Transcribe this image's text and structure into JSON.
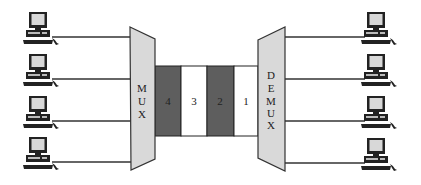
{
  "diagram": {
    "type": "time-division multiplexing",
    "mux": {
      "label_letters": [
        "M",
        "U",
        "X"
      ],
      "fill": "#d9d9d9"
    },
    "demux": {
      "label_letters": [
        "D",
        "E",
        "M",
        "U",
        "X"
      ],
      "fill": "#d9d9d9"
    },
    "slots": [
      {
        "label": "4",
        "fill": "#5e5e5e"
      },
      {
        "label": "3",
        "fill": "#ffffff"
      },
      {
        "label": "2",
        "fill": "#5e5e5e"
      },
      {
        "label": "1",
        "fill": "#ffffff"
      }
    ],
    "left_computers": 4,
    "right_computers": 4,
    "line_color": "#333333"
  }
}
